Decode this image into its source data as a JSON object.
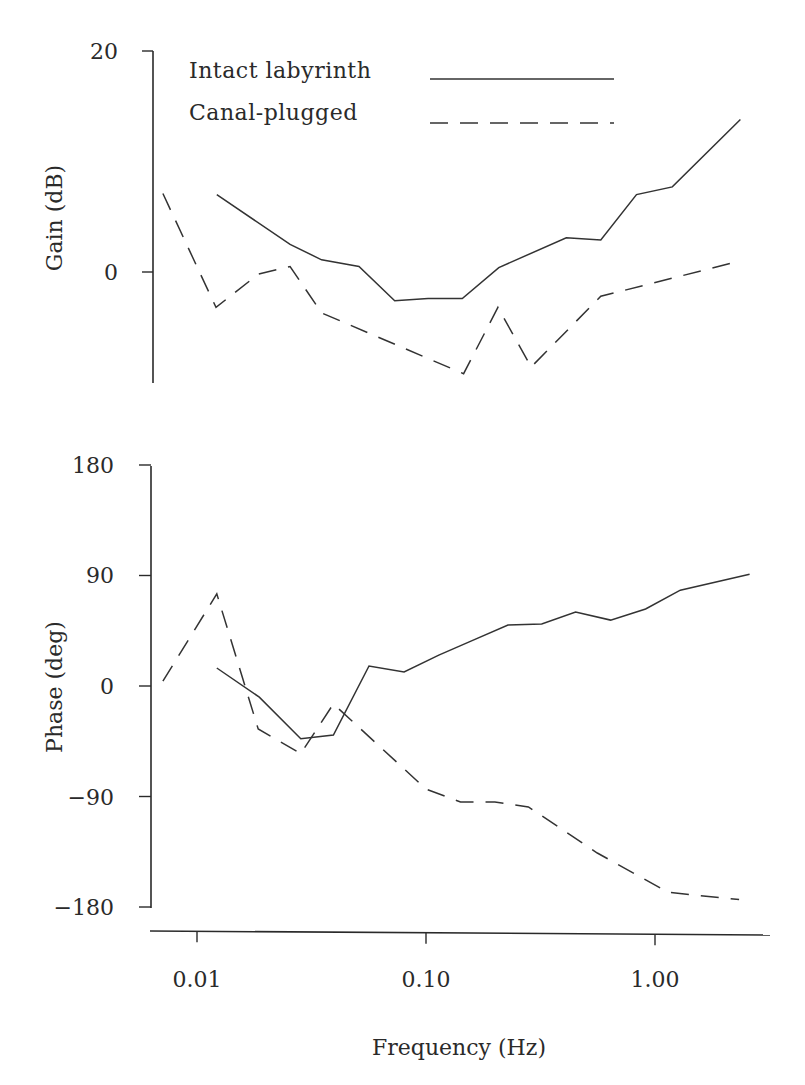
{
  "chart_data": [
    {
      "type": "line",
      "panel": "gain",
      "title": "",
      "xlabel": "Frequency (Hz)",
      "ylabel": "Gain (dB)",
      "xscale": "log",
      "xlim": [
        0.0065,
        3.0
      ],
      "ylim": [
        -10,
        20
      ],
      "yticks": [
        0,
        20
      ],
      "ytick_labels": [
        "0",
        "20"
      ],
      "grid": false,
      "legend": {
        "position": "upper-left-inside",
        "entries": [
          {
            "label": "Intact labyrinth",
            "style": "solid"
          },
          {
            "label": "Canal-plugged",
            "style": "dashed"
          }
        ]
      },
      "series": [
        {
          "name": "Intact labyrinth",
          "style": "solid",
          "x": [
            0.0122,
            0.0255,
            0.035,
            0.051,
            0.073,
            0.102,
            0.144,
            0.208,
            0.41,
            0.58,
            0.83,
            1.19,
            2.36
          ],
          "y": [
            7.0,
            2.5,
            1.1,
            0.5,
            -2.6,
            -2.4,
            -2.4,
            0.4,
            3.1,
            2.9,
            7.0,
            7.7,
            13.8
          ]
        },
        {
          "name": "Canal-plugged",
          "style": "dashed",
          "x": [
            0.0071,
            0.0121,
            0.0185,
            0.0255,
            0.035,
            0.146,
            0.206,
            0.288,
            0.58,
            2.36
          ],
          "y": [
            7.1,
            -3.2,
            -0.2,
            0.5,
            -3.7,
            -9.2,
            -3.2,
            -8.6,
            -2.2,
            1.0
          ]
        }
      ]
    },
    {
      "type": "line",
      "panel": "phase",
      "title": "",
      "xlabel": "Frequency (Hz)",
      "ylabel": "Phase (deg)",
      "xscale": "log",
      "xlim": [
        0.0065,
        3.0
      ],
      "ylim": [
        -180,
        180
      ],
      "yticks": [
        -180,
        -90,
        0,
        90,
        180
      ],
      "ytick_labels": [
        "-180",
        "-90",
        "0",
        "90",
        "180"
      ],
      "xticks": [
        0.01,
        0.1,
        1.0
      ],
      "xtick_labels": [
        "0.01",
        "0.10",
        "1.00"
      ],
      "grid": false,
      "series": [
        {
          "name": "Intact labyrinth",
          "style": "solid",
          "x": [
            0.0122,
            0.0187,
            0.0284,
            0.0394,
            0.0564,
            0.0802,
            0.1137,
            0.159,
            0.228,
            0.32,
            0.45,
            0.64,
            0.91,
            1.29,
            2.59
          ],
          "y": [
            14.7,
            -9.0,
            -43.0,
            -40.0,
            16.3,
            11.4,
            25.2,
            37.0,
            49.7,
            50.5,
            60.3,
            53.7,
            62.7,
            78.0,
            91.0
          ]
        },
        {
          "name": "Canal-plugged",
          "style": "dashed",
          "x": [
            0.0071,
            0.0122,
            0.0185,
            0.0284,
            0.0394,
            0.1,
            0.1415,
            0.2,
            0.28,
            0.56,
            1.14,
            2.33
          ],
          "y": [
            4.0,
            75.0,
            -35.0,
            -55.0,
            -14.6,
            -84.0,
            -94.5,
            -94.5,
            -98.5,
            -136.0,
            -168.0,
            -174.0
          ]
        }
      ]
    }
  ],
  "figure": {
    "gain_axis_label": "Gain (dB)",
    "phase_axis_label": "Phase (deg)",
    "x_axis_label": "Frequency (Hz)",
    "gain_ticks": [
      {
        "label": "20",
        "value": 20
      },
      {
        "label": "0",
        "value": 0
      }
    ],
    "phase_ticks": [
      {
        "label": "180",
        "value": 180
      },
      {
        "label": "90",
        "value": 90
      },
      {
        "label": "0",
        "value": 0
      },
      {
        "label": "−90",
        "value": -90
      },
      {
        "label": "−180",
        "value": -180
      }
    ],
    "x_ticks": [
      {
        "label": "0.01",
        "value": 0.01
      },
      {
        "label": "0.10",
        "value": 0.1
      },
      {
        "label": "1.00",
        "value": 1.0
      }
    ],
    "legend": {
      "intact_label": "Intact labyrinth",
      "canal_label": "Canal-plugged"
    },
    "colors": {
      "line": "#333333",
      "axis": "#2a2a2a",
      "background": "#ffffff"
    }
  }
}
